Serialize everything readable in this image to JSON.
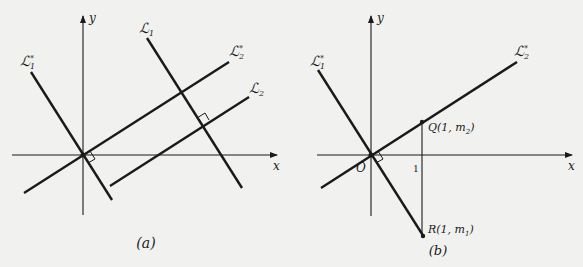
{
  "figure": {
    "panels": [
      {
        "id": "a",
        "caption": "(a)",
        "axes": {
          "x_label": "x",
          "y_label": "y"
        },
        "lines": [
          {
            "name": "L1*",
            "label": "ℒ",
            "sub": "1",
            "sup": "*"
          },
          {
            "name": "L2*",
            "label": "ℒ",
            "sub": "2",
            "sup": "*"
          },
          {
            "name": "L1",
            "label": "ℒ",
            "sub": "1",
            "sup": ""
          },
          {
            "name": "L2",
            "label": "ℒ",
            "sub": "2",
            "sup": ""
          }
        ]
      },
      {
        "id": "b",
        "caption": "(b)",
        "axes": {
          "x_label": "x",
          "y_label": "y"
        },
        "origin_label": "O",
        "tick_label": "1",
        "lines": [
          {
            "name": "L1*",
            "label": "ℒ",
            "sub": "1",
            "sup": "*"
          },
          {
            "name": "L2*",
            "label": "ℒ",
            "sub": "2",
            "sup": "*"
          }
        ],
        "points": [
          {
            "name": "Q",
            "label": "Q(1, m",
            "sub": "2",
            "close": ")"
          },
          {
            "name": "R",
            "label": "R(1, m",
            "sub": "1",
            "close": ")"
          }
        ]
      }
    ]
  },
  "colors": {
    "background": "#f1f1ef",
    "ink": "#1a1a1a"
  }
}
